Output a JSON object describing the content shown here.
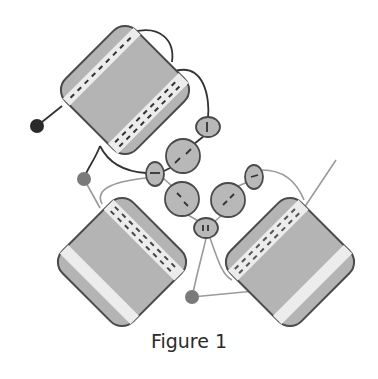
{
  "figure": {
    "caption": "Figure 1",
    "colors": {
      "block_fill": "#b4b4b4",
      "block_stroke": "#4a4a4a",
      "stripe": "#ececec",
      "bead_fill": "#b8b8b8",
      "dark_line": "#333333",
      "light_line": "#9a9a9a",
      "dark_dot": "#2a2a2a",
      "mid_dot": "#7a7a7a"
    },
    "blocks": [
      {
        "name": "top-block",
        "cx": 125,
        "cy": 90
      },
      {
        "name": "bottom-left-block",
        "cx": 122,
        "cy": 262
      },
      {
        "name": "bottom-right-block",
        "cx": 290,
        "cy": 262
      }
    ],
    "beads": [
      {
        "name": "bead-1",
        "cx": 208,
        "cy": 127,
        "rx": 12,
        "ry": 10
      },
      {
        "name": "bead-2",
        "cx": 183,
        "cy": 156,
        "rx": 17,
        "ry": 17
      },
      {
        "name": "bead-3",
        "cx": 155,
        "cy": 174,
        "rx": 9,
        "ry": 12
      },
      {
        "name": "bead-4",
        "cx": 182,
        "cy": 199,
        "rx": 17,
        "ry": 17
      },
      {
        "name": "bead-5",
        "cx": 228,
        "cy": 200,
        "rx": 17,
        "ry": 17
      },
      {
        "name": "bead-6",
        "cx": 254,
        "cy": 177,
        "rx": 9,
        "ry": 12
      },
      {
        "name": "bead-7",
        "cx": 206,
        "cy": 228,
        "rx": 12,
        "ry": 10
      }
    ],
    "terminals": [
      {
        "name": "dark-terminal-dot",
        "cx": 37,
        "cy": 126,
        "r": 7
      },
      {
        "name": "mid-terminal-dot-left",
        "cx": 84,
        "cy": 179,
        "r": 7
      },
      {
        "name": "mid-terminal-dot-bottom",
        "cx": 192,
        "cy": 297,
        "r": 7
      }
    ]
  }
}
